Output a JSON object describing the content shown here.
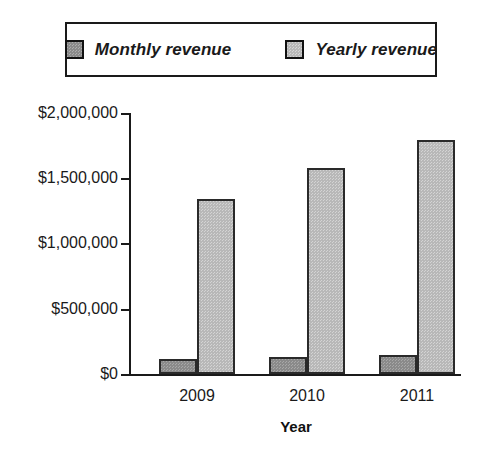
{
  "legend": {
    "entries": [
      {
        "label": "Monthly revenue",
        "series_key": "monthly",
        "color": "#8a8a8a"
      },
      {
        "label": "Yearly revenue",
        "series_key": "yearly",
        "color": "#b8b8b8"
      }
    ]
  },
  "axes": {
    "y_tick_labels": [
      "$2,000,000",
      "$1,500,000",
      "$1,000,000",
      "$500,000",
      "$0"
    ],
    "x_tick_labels": [
      "2009",
      "2010",
      "2011"
    ],
    "x_title": "Year",
    "y_title": ""
  },
  "chart_data": {
    "type": "bar",
    "title": "",
    "subtitle": "",
    "xlabel": "Year",
    "ylabel": "",
    "categories": [
      "2009",
      "2010",
      "2011"
    ],
    "series": [
      {
        "name": "Monthly revenue",
        "color": "#8a8a8a",
        "values": [
          115000,
          130000,
          145000
        ]
      },
      {
        "name": "Yearly revenue",
        "color": "#b8b8b8",
        "values": [
          1340000,
          1580000,
          1790000
        ]
      }
    ],
    "ylim": [
      0,
      2000000
    ],
    "ytick_values": [
      0,
      500000,
      1000000,
      1500000,
      2000000
    ],
    "ytick_labels": [
      "$0",
      "$500,000",
      "$1,000,000",
      "$1,500,000",
      "$2,000,000"
    ],
    "grid": false,
    "legend_position": "top",
    "annotations": []
  }
}
